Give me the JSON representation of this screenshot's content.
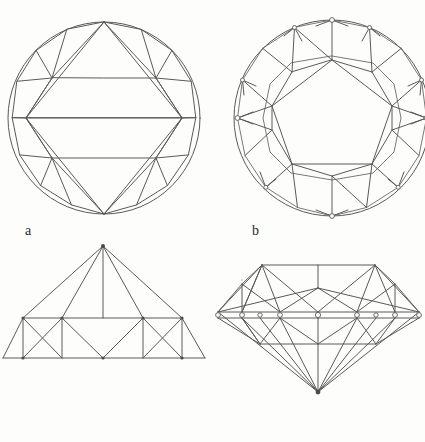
{
  "page": {
    "background_color": "#fdfdfb",
    "line_color": "#5a5a5a",
    "text_color": "#2a2a2a",
    "width": 425,
    "height": 442
  },
  "captions": {
    "a": "a",
    "b": "b"
  },
  "figures": {
    "crown_view": {
      "name": "crown-facet-diagram",
      "label": "a",
      "shape": "circle",
      "center_x": 104,
      "center_y": 118,
      "radius": 97,
      "girdle_facets": 16,
      "table_shape": "hexagon"
    },
    "pavilion_view": {
      "name": "pavilion-facet-diagram",
      "label": "b",
      "shape": "circle",
      "center_x": 332,
      "center_y": 118,
      "radius": 99,
      "girdle_facets": 16,
      "culet_shape": "hexadecagon"
    },
    "crown_profile": {
      "name": "crown-profile-diagram",
      "baseline_y": 358,
      "apex_x": 103,
      "apex_y": 246
    },
    "full_profile": {
      "name": "full-stone-profile-diagram",
      "girdle_y": 318,
      "culet_x": 338,
      "culet_y": 392
    }
  }
}
